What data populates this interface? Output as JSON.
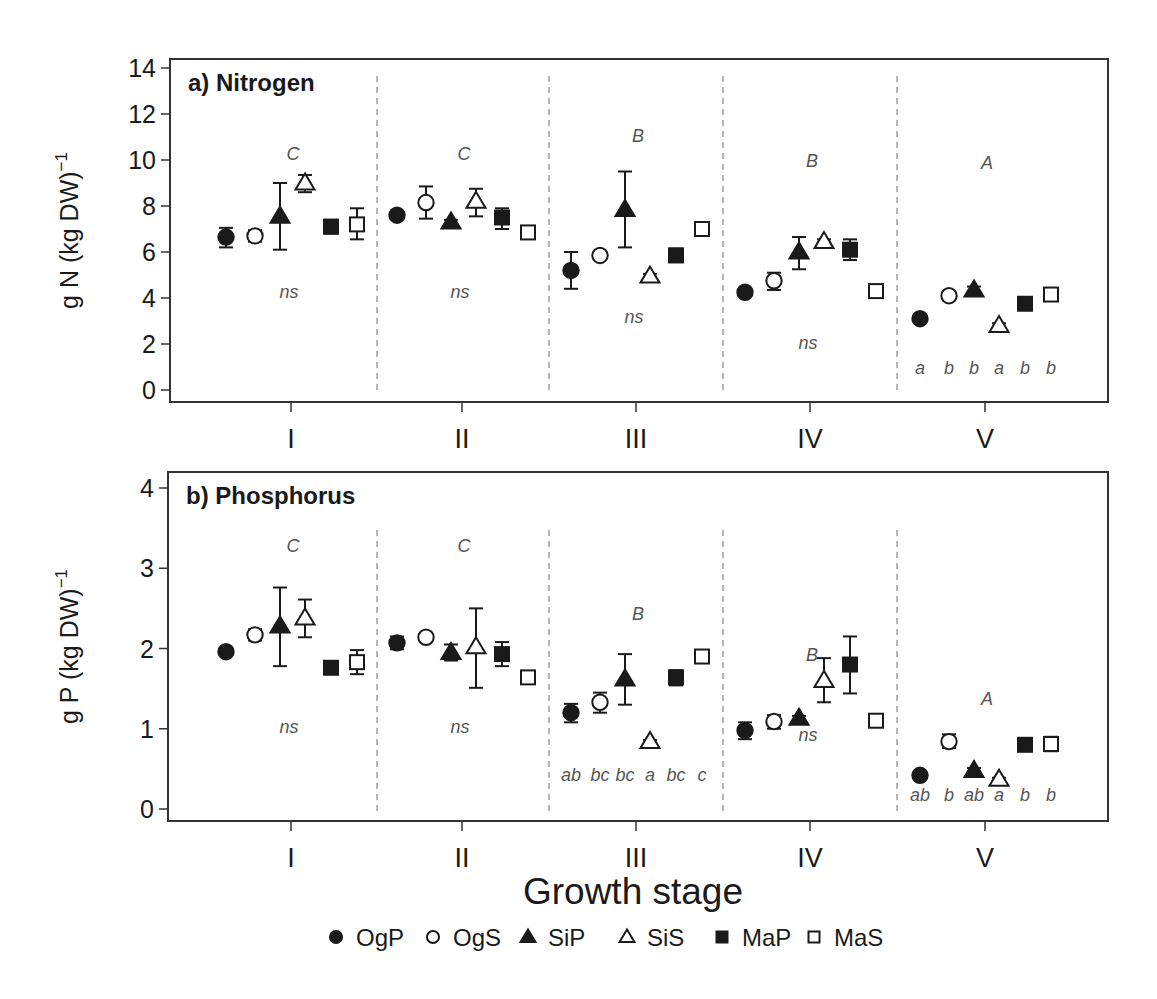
{
  "figure": {
    "xlabel": "Growth stage",
    "stages": [
      "I",
      "II",
      "III",
      "IV",
      "V"
    ]
  },
  "legend": {
    "items": [
      {
        "label": "OgP",
        "marker": "filled-circle"
      },
      {
        "label": "OgS",
        "marker": "open-circle"
      },
      {
        "label": "SiP",
        "marker": "filled-triangle"
      },
      {
        "label": "SiS",
        "marker": "open-triangle"
      },
      {
        "label": "MaP",
        "marker": "filled-square"
      },
      {
        "label": "MaS",
        "marker": "open-square"
      }
    ]
  },
  "colors": {
    "ink": "#1a1a1a",
    "annotation": "#555555",
    "divider": "#888888",
    "background": "#ffffff"
  },
  "chart_data": [
    {
      "type": "scatter",
      "title": "a) Nitrogen",
      "xlabel": "Growth stage",
      "ylabel": "g N (kg DW)⁻¹",
      "ylabel_main": "g N (kg DW)",
      "ylabel_sup": "−1",
      "ylim": [
        0,
        14
      ],
      "yticks": [
        0,
        2,
        4,
        6,
        8,
        10,
        12,
        14
      ],
      "grid": false,
      "legend_position": "bottom",
      "categories": [
        "I",
        "II",
        "III",
        "IV",
        "V"
      ],
      "stage_letters": [
        "C",
        "C",
        "B",
        "B",
        "A"
      ],
      "stage_letter_y": [
        10.0,
        10.0,
        10.8,
        9.7,
        9.6
      ],
      "within_stage_labels": [
        {
          "stage": "I",
          "text": [
            "ns"
          ],
          "y": 4.0
        },
        {
          "stage": "II",
          "text": [
            "ns"
          ],
          "y": 4.0
        },
        {
          "stage": "III",
          "text": [
            "ns"
          ],
          "y": 2.9
        },
        {
          "stage": "IV",
          "text": [
            "ns"
          ],
          "y": 1.8
        },
        {
          "stage": "V",
          "text": [
            "a",
            "b",
            "b",
            "a",
            "b",
            "b"
          ],
          "y": 0.7
        }
      ],
      "series": [
        {
          "name": "OgP",
          "values": [
            6.65,
            7.6,
            5.2,
            4.25,
            3.1
          ],
          "err_low": [
            6.2,
            7.55,
            4.4,
            4.15,
            3.0
          ],
          "err_high": [
            7.05,
            7.65,
            6.0,
            4.35,
            3.2
          ]
        },
        {
          "name": "OgS",
          "values": [
            6.7,
            8.15,
            5.85,
            4.75,
            4.1
          ],
          "err_low": [
            6.45,
            7.45,
            5.75,
            4.35,
            3.9
          ],
          "err_high": [
            6.95,
            8.85,
            5.95,
            5.1,
            4.3
          ]
        },
        {
          "name": "SiP",
          "values": [
            7.55,
            7.3,
            7.85,
            6.0,
            4.35
          ],
          "err_low": [
            6.1,
            7.2,
            6.2,
            5.25,
            4.2
          ],
          "err_high": [
            9.0,
            7.4,
            9.5,
            6.65,
            4.5
          ]
        },
        {
          "name": "SiS",
          "values": [
            9.0,
            8.2,
            4.95,
            6.45,
            2.8
          ],
          "err_low": [
            8.6,
            7.55,
            4.85,
            6.35,
            2.65
          ],
          "err_high": [
            9.35,
            8.75,
            5.05,
            6.55,
            2.9
          ]
        },
        {
          "name": "MaP",
          "values": [
            7.1,
            7.5,
            5.85,
            6.1,
            3.75
          ],
          "err_low": [
            6.8,
            7.0,
            5.6,
            5.65,
            3.65
          ],
          "err_high": [
            7.4,
            7.9,
            6.15,
            6.55,
            3.85
          ]
        },
        {
          "name": "MaS",
          "values": [
            7.2,
            6.85,
            7.0,
            4.3,
            4.15
          ],
          "err_low": [
            6.55,
            6.7,
            6.85,
            4.05,
            3.95
          ],
          "err_high": [
            7.9,
            7.0,
            7.15,
            4.55,
            4.35
          ]
        }
      ]
    },
    {
      "type": "scatter",
      "title": "b) Phosphorus",
      "xlabel": "Growth stage",
      "ylabel": "g P (kg DW)⁻¹",
      "ylabel_main": "g P (kg DW)",
      "ylabel_sup": "−1",
      "ylim": [
        0,
        4
      ],
      "yticks": [
        0,
        1,
        2,
        3,
        4
      ],
      "grid": false,
      "legend_position": "bottom",
      "categories": [
        "I",
        "II",
        "III",
        "IV",
        "V"
      ],
      "stage_letters": [
        "C",
        "C",
        "B",
        "B",
        "A"
      ],
      "stage_letter_y": [
        3.2,
        3.2,
        2.35,
        1.85,
        1.3
      ],
      "within_stage_labels": [
        {
          "stage": "I",
          "text": [
            "ns"
          ],
          "y": 0.95
        },
        {
          "stage": "II",
          "text": [
            "ns"
          ],
          "y": 0.95
        },
        {
          "stage": "III",
          "text": [
            "ab",
            "bc",
            "bc",
            "a",
            "bc",
            "c"
          ],
          "y": 0.35
        },
        {
          "stage": "IV",
          "text": [
            "ns"
          ],
          "y": 0.85
        },
        {
          "stage": "V",
          "text": [
            "ab",
            "b",
            "ab",
            "a",
            "b",
            "b"
          ],
          "y": 0.1
        }
      ],
      "series": [
        {
          "name": "OgP",
          "values": [
            1.96,
            2.07,
            1.2,
            0.98,
            0.42
          ],
          "err_low": [
            1.94,
            1.99,
            1.08,
            0.87,
            0.4
          ],
          "err_high": [
            1.98,
            2.15,
            1.31,
            1.08,
            0.44
          ]
        },
        {
          "name": "OgS",
          "values": [
            2.17,
            2.14,
            1.33,
            1.09,
            0.84
          ],
          "err_low": [
            2.1,
            2.09,
            1.2,
            1.0,
            0.76
          ],
          "err_high": [
            2.24,
            2.19,
            1.45,
            1.17,
            0.93
          ]
        },
        {
          "name": "SiP",
          "values": [
            2.28,
            1.95,
            1.62,
            1.13,
            0.48
          ],
          "err_low": [
            1.78,
            1.85,
            1.3,
            1.1,
            0.45
          ],
          "err_high": [
            2.76,
            2.05,
            1.93,
            1.16,
            0.51
          ]
        },
        {
          "name": "SiS",
          "values": [
            2.38,
            2.02,
            0.84,
            1.6,
            0.37
          ],
          "err_low": [
            2.14,
            1.51,
            0.82,
            1.33,
            0.35
          ],
          "err_high": [
            2.61,
            2.5,
            0.86,
            1.88,
            0.39
          ]
        },
        {
          "name": "MaP",
          "values": [
            1.76,
            1.93,
            1.64,
            1.8,
            0.8
          ],
          "err_low": [
            1.71,
            1.78,
            1.54,
            1.44,
            0.78
          ],
          "err_high": [
            1.81,
            2.08,
            1.73,
            2.15,
            0.82
          ]
        },
        {
          "name": "MaS",
          "values": [
            1.83,
            1.64,
            1.9,
            1.1,
            0.81
          ],
          "err_low": [
            1.68,
            1.59,
            1.86,
            1.06,
            0.72
          ],
          "err_high": [
            1.98,
            1.69,
            1.94,
            1.14,
            0.9
          ]
        }
      ]
    }
  ]
}
